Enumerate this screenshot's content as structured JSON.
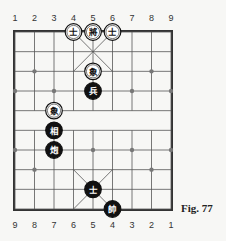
{
  "figure": {
    "caption": "Fig. 77",
    "top_file_labels": [
      "1",
      "2",
      "3",
      "4",
      "5",
      "6",
      "7",
      "8",
      "9"
    ],
    "bottom_file_labels": [
      "9",
      "8",
      "7",
      "6",
      "5",
      "4",
      "3",
      "2",
      "1"
    ]
  },
  "board": {
    "files": 9,
    "ranks": 10,
    "colors": {
      "line": "#555555",
      "frame": "#333333",
      "background": "#f7f7f5",
      "piece_dark": "#111111",
      "piece_light": "#ffffff"
    }
  },
  "pieces": [
    {
      "side": "black",
      "style": "light",
      "char": "士",
      "name": "advisor",
      "file": 4,
      "rank": 1
    },
    {
      "side": "black",
      "style": "light",
      "char": "將",
      "name": "general",
      "file": 5,
      "rank": 1
    },
    {
      "side": "black",
      "style": "light",
      "char": "士",
      "name": "advisor",
      "file": 6,
      "rank": 1
    },
    {
      "side": "black",
      "style": "light",
      "char": "象",
      "name": "elephant",
      "file": 5,
      "rank": 3
    },
    {
      "side": "red",
      "style": "dark",
      "char": "兵",
      "name": "soldier",
      "file": 5,
      "rank": 4
    },
    {
      "side": "black",
      "style": "light",
      "char": "象",
      "name": "elephant",
      "file": 3,
      "rank": 5
    },
    {
      "side": "red",
      "style": "dark",
      "char": "相",
      "name": "minister",
      "file": 3,
      "rank": 6
    },
    {
      "side": "red",
      "style": "dark",
      "char": "炮",
      "name": "cannon",
      "file": 3,
      "rank": 7
    },
    {
      "side": "red",
      "style": "dark",
      "char": "士",
      "name": "advisor",
      "file": 5,
      "rank": 9
    },
    {
      "side": "red",
      "style": "dark",
      "char": "帥",
      "name": "general",
      "file": 6,
      "rank": 10
    }
  ]
}
